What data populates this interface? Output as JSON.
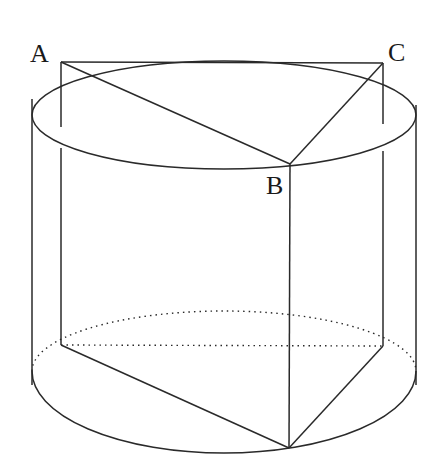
{
  "diagram": {
    "type": "cylinder-with-inscribed-triangular-prism",
    "stroke_color": "#2a2a2a",
    "background": "#ffffff",
    "points": {
      "A": {
        "label": "A",
        "x": 61,
        "y": 62,
        "label_x": 30,
        "label_y": 41
      },
      "B": {
        "label": "B",
        "x": 290,
        "y": 164,
        "label_x": 266,
        "label_y": 173
      },
      "C": {
        "label": "C",
        "x": 383,
        "y": 63,
        "label_x": 388,
        "label_y": 40
      },
      "A1": {
        "x": 61,
        "y": 345
      },
      "B1": {
        "x": 289,
        "y": 448
      },
      "C1": {
        "x": 383,
        "y": 346
      }
    },
    "top_ellipse": {
      "cx": 224,
      "cy": 115,
      "rx": 192,
      "ry": 54
    },
    "bottom_ellipse": {
      "cx": 224,
      "cy": 399,
      "rx": 192,
      "ry": 54
    }
  }
}
